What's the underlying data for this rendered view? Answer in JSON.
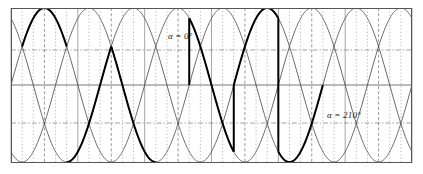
{
  "figure": {
    "background_color": "#ffffff",
    "frame": {
      "x": 11,
      "y": 8,
      "width": 401,
      "height": 155,
      "stroke_color": "#555555",
      "stroke_width": 1
    }
  },
  "annotations": [
    {
      "name": "alpha-0-label",
      "text": "α = 0°",
      "x": 168,
      "y": 31
    },
    {
      "name": "alpha-210-label",
      "text": "α = 210°",
      "x": 327,
      "y": 110
    }
  ],
  "axes": {
    "zero_line": {
      "y_px": 85,
      "color": "#777777",
      "width": 1,
      "style": "solid"
    },
    "horizontal_gridlines": [
      {
        "value": 0.5,
        "y_px": 50,
        "color": "#8a8a8a",
        "style": "dash-dot"
      },
      {
        "value": -0.5,
        "y_px": 123,
        "color": "#8a8a8a",
        "style": "dash-dot"
      }
    ],
    "vertical_gridlines": {
      "count": 36,
      "spacing_px": 11.14,
      "solid_every": 6,
      "solid_color": "#8f8f8f",
      "dotted_color": "#9a9a9a",
      "dashed_color": "#6f6f6f"
    },
    "amplitude_px": 77,
    "xlim_deg": [
      0,
      1080
    ],
    "ylim": [
      -1.1,
      1.1
    ]
  },
  "chart_data": {
    "type": "line",
    "xlabel": "",
    "ylabel": "",
    "xlim": [
      0,
      1080
    ],
    "ylim": [
      -1.1,
      1.1
    ],
    "grid": true,
    "legend": "none",
    "x_unit": "degrees",
    "series": [
      {
        "name": "phase-a",
        "phase_deg": 0,
        "amplitude": 1.0,
        "style": "thin",
        "color": "#4d4d4d"
      },
      {
        "name": "phase-b",
        "phase_deg": -120,
        "amplitude": 1.0,
        "style": "thin",
        "color": "#4d4d4d"
      },
      {
        "name": "phase-c",
        "phase_deg": 120,
        "amplitude": 1.0,
        "style": "thin",
        "color": "#4d4d4d"
      }
    ],
    "annotations": [
      {
        "label": "α = 0°",
        "firing_angle_deg": 0
      },
      {
        "label": "α = 210°",
        "firing_angle_deg": 210
      }
    ],
    "highlighted_segments": [
      {
        "name": "alpha0-conduction-1",
        "x_deg": [
          30,
          150
        ],
        "phase_deg": 0,
        "polarity": "positive"
      },
      {
        "name": "alpha0-conduction-2",
        "x_deg": [
          150,
          270
        ],
        "phase_deg": -120,
        "polarity": "positive"
      },
      {
        "name": "alpha0-conduction-3",
        "x_deg": [
          270,
          390
        ],
        "phase_deg": 120,
        "polarity": "positive"
      },
      {
        "name": "alpha210-conduction-1",
        "x_deg": [
          480,
          600
        ],
        "phase_deg": 0,
        "polarity": "negative"
      },
      {
        "name": "alpha210-conduction-2",
        "x_deg": [
          600,
          720
        ],
        "phase_deg": -120,
        "polarity": "negative"
      },
      {
        "name": "alpha210-conduction-3",
        "x_deg": [
          720,
          840
        ],
        "phase_deg": 120,
        "polarity": "negative"
      }
    ],
    "colors": {
      "thin_trace": "#4d4d4d",
      "thick_trace": "#000000",
      "frame": "#555555",
      "grid": "#8f8f8f"
    }
  }
}
